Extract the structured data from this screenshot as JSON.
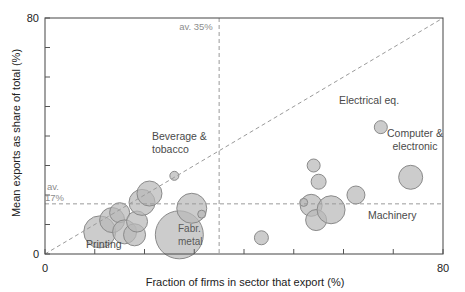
{
  "chart_data": {
    "type": "scatter",
    "title": "",
    "xlabel": "Fraction of firms in sector that export (%)",
    "ylabel": "Mean exports as share of total (%)",
    "xlim": [
      0,
      80
    ],
    "ylim": [
      0,
      80
    ],
    "xticks": [
      0,
      10,
      20,
      30,
      40,
      50,
      60,
      70,
      80
    ],
    "yticks": [
      0,
      10,
      20,
      30,
      40,
      50,
      60,
      70,
      80
    ],
    "xtick_labels_shown": [
      "0",
      "80"
    ],
    "ytick_labels_shown": [
      "0",
      "80"
    ],
    "grid": false,
    "legend": false,
    "bubble_size_meaning": "sector size",
    "reference_lines": [
      {
        "name": "av-x",
        "orientation": "vertical",
        "value": 35,
        "label": "av. 35%",
        "style": "dashed"
      },
      {
        "name": "av-y",
        "orientation": "horizontal",
        "value": 17,
        "label_line1": "av.",
        "label_line2": "17%",
        "style": "dashed"
      },
      {
        "name": "identity",
        "orientation": "diagonal",
        "from": [
          0,
          0
        ],
        "to": [
          80,
          80
        ],
        "label": "",
        "style": "dashed"
      }
    ],
    "points": [
      {
        "label": "Printing",
        "x": 11.0,
        "y": 7.5,
        "r": 16.0,
        "label_pos": "below"
      },
      {
        "label": "",
        "x": 13.5,
        "y": 11.5,
        "r": 12.5,
        "label_pos": "none"
      },
      {
        "label": "",
        "x": 15.0,
        "y": 14.0,
        "r": 10.0,
        "label_pos": "none"
      },
      {
        "label": "",
        "x": 16.0,
        "y": 7.5,
        "r": 12.0,
        "label_pos": "none"
      },
      {
        "label": "",
        "x": 18.0,
        "y": 6.5,
        "r": 11.0,
        "label_pos": "none"
      },
      {
        "label": "",
        "x": 18.5,
        "y": 11.0,
        "r": 10.5,
        "label_pos": "none"
      },
      {
        "label": "",
        "x": 19.5,
        "y": 17.5,
        "r": 13.0,
        "label_pos": "none"
      },
      {
        "label": "",
        "x": 21.0,
        "y": 20.5,
        "r": 12.5,
        "label_pos": "none"
      },
      {
        "label": "Beverage & tobacco",
        "x": 26.0,
        "y": 26.5,
        "r": 4.5,
        "label_pos": "above"
      },
      {
        "label": "Fabr. metal",
        "x": 27.0,
        "y": 6.5,
        "r": 24.0,
        "label_pos": "inside"
      },
      {
        "label": "",
        "x": 29.5,
        "y": 15.5,
        "r": 15.0,
        "label_pos": "none"
      },
      {
        "label": "",
        "x": 31.5,
        "y": 13.5,
        "r": 4.0,
        "label_pos": "none"
      },
      {
        "label": "",
        "x": 43.5,
        "y": 5.5,
        "r": 7.0,
        "label_pos": "none"
      },
      {
        "label": "",
        "x": 54.0,
        "y": 30.0,
        "r": 6.5,
        "label_pos": "none"
      },
      {
        "label": "",
        "x": 55.0,
        "y": 24.5,
        "r": 7.5,
        "label_pos": "none"
      },
      {
        "label": "",
        "x": 53.5,
        "y": 16.5,
        "r": 11.0,
        "label_pos": "none"
      },
      {
        "label": "",
        "x": 52.0,
        "y": 17.5,
        "r": 4.0,
        "label_pos": "none"
      },
      {
        "label": "",
        "x": 54.5,
        "y": 11.5,
        "r": 10.5,
        "label_pos": "none"
      },
      {
        "label": "Machinery",
        "x": 57.5,
        "y": 15.0,
        "r": 14.0,
        "label_pos": "right"
      },
      {
        "label": "",
        "x": 62.5,
        "y": 20.0,
        "r": 9.0,
        "label_pos": "none"
      },
      {
        "label": "Electrical eq.",
        "x": 67.5,
        "y": 43.0,
        "r": 6.5,
        "label_pos": "above"
      },
      {
        "label": "Computer & electronic",
        "x": 73.5,
        "y": 26.0,
        "r": 12.0,
        "label_pos": "above"
      }
    ],
    "colors": {
      "bubble_fill": "#b8b8b8",
      "bubble_stroke": "#8a8a8a",
      "axis": "#555555",
      "reference_line": "#9a9a9a",
      "text": "#3a3a3a",
      "background": "#ffffff"
    }
  },
  "axes": {
    "x_title": "Fraction of firms in sector that export (%)",
    "y_title": "Mean exports as share of total (%)",
    "x_min_label": "0",
    "x_max_label": "80",
    "y_min_label": "0",
    "y_max_label": "80"
  },
  "annotations": {
    "av_x": "av. 35%",
    "av_y_line1": "av.",
    "av_y_line2": "17%"
  },
  "labels": {
    "printing": "Printing",
    "beverage_line1": "Beverage &",
    "beverage_line2": "tobacco",
    "fabr_line1": "Fabr.",
    "fabr_line2": "metal",
    "machinery": "Machinery",
    "electrical": "Electrical eq.",
    "computer_line1": "Computer &",
    "computer_line2": "electronic"
  }
}
